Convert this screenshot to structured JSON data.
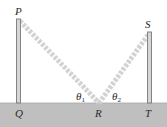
{
  "diagram": {
    "points": {
      "P": "P",
      "Q": "Q",
      "R": "R",
      "S": "S",
      "T": "T"
    },
    "angles": {
      "theta1": {
        "symbol": "θ",
        "subscript": "1"
      },
      "theta2": {
        "symbol": "θ",
        "subscript": "2"
      }
    },
    "colors": {
      "ground": "#bfbfbf",
      "pole_fill": "#d6d6d6",
      "pole_stroke": "#7a7a7a",
      "beam": "#cfcfcf",
      "text": "#2a2a2a"
    }
  }
}
